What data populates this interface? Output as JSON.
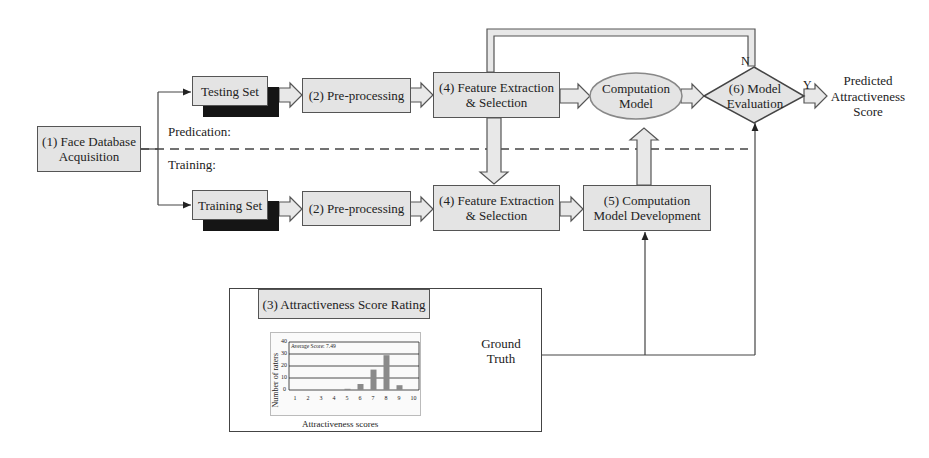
{
  "diagram": {
    "nodes": {
      "face_db": "(1) Face Database Acquisition",
      "face_db_l1": "(1) Face Database",
      "face_db_l2": "Acquisition",
      "testing_set": "Testing Set",
      "training_set": "Training Set",
      "preproc_test": "(2) Pre-processing",
      "preproc_train": "(2) Pre-processing",
      "feat_test_l1": "(4) Feature Extraction",
      "feat_test_l2": "& Selection",
      "feat_train_l1": "(4) Feature Extraction",
      "feat_train_l2": "& Selection",
      "comp_model_l1": "Computation",
      "comp_model_l2": "Model",
      "comp_dev_l1": "(5) Computation",
      "comp_dev_l2": "Model Development",
      "eval_l1": "(6) Model",
      "eval_l2": "Evaluation",
      "output_l1": "Predicted",
      "output_l2": "Attractiveness",
      "output_l3": "Score",
      "rating": "(3) Attractiveness Score Rating",
      "ground_truth_l1": "Ground",
      "ground_truth_l2": "Truth"
    },
    "labels": {
      "prediction": "Predication:",
      "training": "Training:",
      "no": "N",
      "yes": "Y"
    }
  },
  "chart_data": {
    "type": "bar",
    "title": "",
    "annotation": "Average Score: 7.49",
    "xlabel": "Attractiveness scores",
    "ylabel": "Number of raters",
    "categories": [
      "1",
      "2",
      "3",
      "4",
      "5",
      "6",
      "7",
      "8",
      "9",
      "10"
    ],
    "values": [
      0,
      0,
      0,
      0,
      1,
      5,
      17,
      29,
      4,
      0
    ],
    "ylim": [
      0,
      40
    ],
    "yticks": [
      "0",
      "10",
      "20",
      "30",
      "40"
    ],
    "grid": true,
    "legend": "none",
    "bar_color": "#8a8a8a"
  }
}
